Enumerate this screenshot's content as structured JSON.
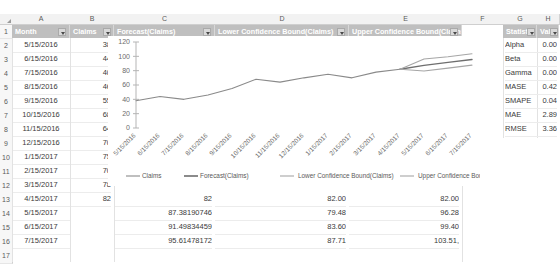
{
  "spreadsheet": {
    "column_letters": [
      "A",
      "B",
      "C",
      "D",
      "E",
      "F",
      "G",
      "H"
    ],
    "row_numbers": [
      "1",
      "2",
      "3",
      "4",
      "5",
      "6",
      "7",
      "8",
      "9",
      "10",
      "11",
      "12",
      "13",
      "14",
      "15",
      "16",
      "17"
    ],
    "table_headers": [
      "Month",
      "Claims",
      "Forecast(Claims)",
      "Lower Confidence Bound(Claims)",
      "Upper Confidence Bound(Claims)"
    ],
    "rows": [
      {
        "month": "5/15/2016",
        "claims": "38",
        "forecast": "",
        "lower": "",
        "upper": ""
      },
      {
        "month": "6/15/2016",
        "claims": "44",
        "forecast": "",
        "lower": "",
        "upper": ""
      },
      {
        "month": "7/15/2016",
        "claims": "40",
        "forecast": "",
        "lower": "",
        "upper": ""
      },
      {
        "month": "8/15/2016",
        "claims": "46",
        "forecast": "",
        "lower": "",
        "upper": ""
      },
      {
        "month": "9/15/2016",
        "claims": "55",
        "forecast": "",
        "lower": "",
        "upper": ""
      },
      {
        "month": "10/15/2016",
        "claims": "68",
        "forecast": "",
        "lower": "",
        "upper": ""
      },
      {
        "month": "11/15/2016",
        "claims": "64",
        "forecast": "",
        "lower": "",
        "upper": ""
      },
      {
        "month": "12/15/2016",
        "claims": "70",
        "forecast": "",
        "lower": "",
        "upper": ""
      },
      {
        "month": "1/15/2017",
        "claims": "75",
        "forecast": "",
        "lower": "",
        "upper": ""
      },
      {
        "month": "2/15/2017",
        "claims": "70",
        "forecast": "",
        "lower": "",
        "upper": ""
      },
      {
        "month": "3/15/2017",
        "claims": "78",
        "forecast": "",
        "lower": "",
        "upper": ""
      },
      {
        "month": "4/15/2017",
        "claims": "82",
        "forecast": "82",
        "lower": "82.00",
        "upper": "82.00"
      },
      {
        "month": "5/15/2017",
        "claims": "",
        "forecast": "87.38190746",
        "lower": "79.48",
        "upper": "96.28"
      },
      {
        "month": "6/15/2017",
        "claims": "",
        "forecast": "91.49834459",
        "lower": "83.60",
        "upper": "99.40"
      },
      {
        "month": "7/15/2017",
        "claims": "",
        "forecast": "95.61478172",
        "lower": "87.71",
        "upper": "103.51,"
      }
    ],
    "stats_headers": [
      "Statistic",
      "Value"
    ],
    "stats": [
      {
        "name": "Alpha",
        "value": "0.00"
      },
      {
        "name": "Beta",
        "value": "0.00"
      },
      {
        "name": "Gamma",
        "value": "0.00"
      },
      {
        "name": "MASE",
        "value": "0.42"
      },
      {
        "name": "SMAPE",
        "value": "0.04"
      },
      {
        "name": "MAE",
        "value": "2.89"
      },
      {
        "name": "RMSE",
        "value": "3.36"
      }
    ]
  },
  "chart_data": {
    "type": "line",
    "title": "",
    "xlabel": "",
    "ylabel": "",
    "ylim": [
      0,
      120
    ],
    "yticks": [
      0,
      20,
      40,
      60,
      80,
      100,
      120
    ],
    "grid": false,
    "legend_position": "bottom",
    "x": [
      "5/15/2016",
      "6/15/2016",
      "7/15/2016",
      "8/15/2016",
      "9/15/2016",
      "10/15/2016",
      "11/15/2016",
      "12/15/2016",
      "1/15/2017",
      "2/15/2017",
      "3/15/2017",
      "4/15/2017",
      "5/15/2017",
      "6/15/2017",
      "7/15/2017"
    ],
    "series": [
      {
        "name": "Claims",
        "color": "#8a8a8a",
        "values": [
          38,
          44,
          40,
          46,
          55,
          68,
          64,
          70,
          75,
          70,
          78,
          82,
          null,
          null,
          null
        ]
      },
      {
        "name": "Forecast(Claims)",
        "color": "#6e6e6e",
        "values": [
          null,
          null,
          null,
          null,
          null,
          null,
          null,
          null,
          null,
          null,
          null,
          82,
          87.38,
          91.5,
          95.61
        ]
      },
      {
        "name": "Lower Confidence Bound(Claims)",
        "color": "#a6a6a6",
        "values": [
          null,
          null,
          null,
          null,
          null,
          null,
          null,
          null,
          null,
          null,
          null,
          82,
          79.48,
          83.6,
          87.71
        ]
      },
      {
        "name": "Upper Confidence Bound(Claims)",
        "color": "#a6a6a6",
        "values": [
          null,
          null,
          null,
          null,
          null,
          null,
          null,
          null,
          null,
          null,
          null,
          82,
          96.28,
          99.4,
          103.51
        ]
      }
    ]
  }
}
